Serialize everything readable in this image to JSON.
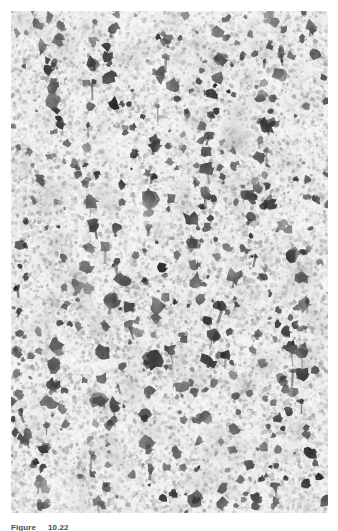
{
  "figure": {
    "caption_label": "Figure",
    "caption_number": "10.22",
    "caption_full": "Figure 10.22",
    "alt_description": "Grayscale transmission electron micrograph showing a grainy light background densely speckled with fine gray noise, overlaid by clusters of dark, irregular particles that align into roughly vertical, branching chain-like filaments running from the top to the bottom of the plate.",
    "media_type": "electron-micrograph",
    "rendering": "grayscale"
  },
  "plate": {
    "left": 11,
    "top": 11,
    "width": 317,
    "height": 502,
    "background_hex": "#ececec",
    "grain_light_hex": "#f7f7f7",
    "grain_mid_hex": "#c9c9c9",
    "grain_dark_hex": "#8f8f8f",
    "particle_hex": "#3a3a3a",
    "particle_core_hex": "#242424",
    "page_background_hex": "#ffffff"
  },
  "texture": {
    "grain_density": 24000,
    "grain_min_radius": 0.6,
    "grain_max_radius": 2.2,
    "filament_count": 11,
    "particles_per_filament_min": 16,
    "particles_per_filament_max": 30,
    "stray_particle_count": 260,
    "filament_orientation": "vertical",
    "random_seed": 20221011
  },
  "filaments": [
    {
      "x_top": 28,
      "x_bottom": 12,
      "wobble": 16,
      "thickness": 1.0
    },
    {
      "x_top": 62,
      "x_bottom": 46,
      "wobble": 20,
      "thickness": 1.15
    },
    {
      "x_top": 86,
      "x_bottom": 104,
      "wobble": 18,
      "thickness": 0.95
    },
    {
      "x_top": 118,
      "x_bottom": 96,
      "wobble": 22,
      "thickness": 1.2
    },
    {
      "x_top": 142,
      "x_bottom": 158,
      "wobble": 15,
      "thickness": 1.0
    },
    {
      "x_top": 172,
      "x_bottom": 150,
      "wobble": 24,
      "thickness": 1.25
    },
    {
      "x_top": 196,
      "x_bottom": 208,
      "wobble": 17,
      "thickness": 1.05
    },
    {
      "x_top": 222,
      "x_bottom": 200,
      "wobble": 20,
      "thickness": 1.1
    },
    {
      "x_top": 252,
      "x_bottom": 266,
      "wobble": 16,
      "thickness": 0.95
    },
    {
      "x_top": 280,
      "x_bottom": 258,
      "wobble": 21,
      "thickness": 1.15
    },
    {
      "x_top": 304,
      "x_bottom": 300,
      "wobble": 14,
      "thickness": 1.0
    }
  ]
}
